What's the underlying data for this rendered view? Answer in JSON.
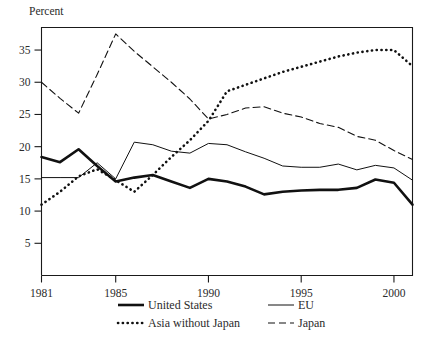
{
  "figure": {
    "y_axis_label": "Percent",
    "background_color": "#ffffff",
    "ink_color": "#111111"
  },
  "chart_data": {
    "type": "line",
    "title": "",
    "subtitle": "",
    "xlabel": "",
    "ylabel": "Percent",
    "xlim": [
      1981,
      2001
    ],
    "ylim": [
      0,
      38.5
    ],
    "yticks": [
      5,
      10,
      15,
      20,
      25,
      30,
      35
    ],
    "ytick_labels": [
      "5",
      "10",
      "15",
      "20",
      "25",
      "30",
      "35"
    ],
    "xticks": [
      1981,
      1985,
      1990,
      1995,
      2000
    ],
    "xtick_labels": [
      "1981",
      "1985",
      "1990",
      "1995",
      "2000"
    ],
    "grid": false,
    "legend_position": "below-axes",
    "x": [
      1981,
      1982,
      1983,
      1984,
      1985,
      1986,
      1987,
      1988,
      1989,
      1990,
      1991,
      1992,
      1993,
      1994,
      1995,
      1996,
      1997,
      1998,
      1999,
      2000,
      2001
    ],
    "series": [
      {
        "name": "United States",
        "style": "solid-thick",
        "stroke_width": 2.6,
        "dash": "none",
        "values": [
          18.4,
          17.6,
          19.6,
          17.0,
          14.6,
          15.2,
          15.6,
          14.6,
          13.6,
          15.0,
          14.6,
          13.8,
          12.6,
          13.0,
          13.2,
          13.3,
          13.3,
          13.6,
          14.9,
          14.4,
          11.0
        ]
      },
      {
        "name": "EU",
        "style": "solid-thin",
        "stroke_width": 1.0,
        "dash": "none",
        "values": [
          15.2,
          15.2,
          15.2,
          17.5,
          15.0,
          20.7,
          20.3,
          19.3,
          19.0,
          20.5,
          20.3,
          19.2,
          18.2,
          17.0,
          16.8,
          16.8,
          17.3,
          16.4,
          17.1,
          16.7,
          14.8
        ]
      },
      {
        "name": "Asia without Japan",
        "style": "dotted",
        "stroke_width": 2.6,
        "dash": "0.2 4.6",
        "values": [
          11.0,
          13.0,
          15.4,
          16.5,
          14.8,
          13.0,
          15.6,
          18.4,
          21.0,
          24.0,
          28.6,
          29.6,
          30.6,
          31.6,
          32.4,
          33.2,
          34.0,
          34.6,
          35.0,
          35.0,
          32.5
        ]
      },
      {
        "name": "Japan",
        "style": "dashed",
        "stroke_width": 1.1,
        "dash": "7 4",
        "values": [
          30.0,
          27.5,
          25.2,
          31.2,
          37.5,
          34.8,
          32.4,
          30.0,
          27.4,
          24.3,
          25.0,
          26.0,
          26.2,
          25.2,
          24.6,
          23.6,
          23.0,
          21.6,
          21.0,
          19.4,
          18.0
        ]
      }
    ]
  },
  "legend": {
    "entries": [
      {
        "label": "United States",
        "swatch": "solid-thick"
      },
      {
        "label": "EU",
        "swatch": "solid-thin"
      },
      {
        "label": "Asia without Japan",
        "swatch": "dotted"
      },
      {
        "label": "Japan",
        "swatch": "dashed"
      }
    ]
  }
}
